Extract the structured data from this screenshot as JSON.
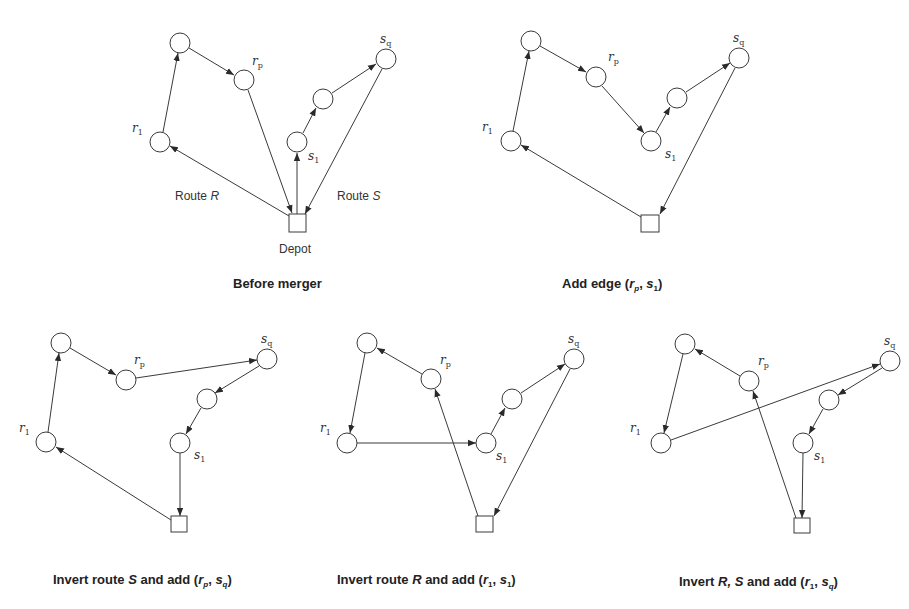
{
  "figure": {
    "panels": [
      {
        "id": "before-merger",
        "caption": "Before merger",
        "labels": {
          "r1": "r",
          "rp": "r",
          "s1": "s",
          "sq": "s",
          "route_r": "Route",
          "route_r_var": "R",
          "route_s": "Route",
          "route_s_var": "S",
          "depot": "Depot"
        }
      },
      {
        "id": "add-edge",
        "caption_prefix": "Add edge (",
        "caption_args": [
          "r",
          "p",
          "s",
          "1"
        ],
        "caption_suffix": ")"
      },
      {
        "id": "invert-s",
        "caption_prefix": "Invert route ",
        "caption_var": "S",
        "caption_mid": " and add (",
        "caption_args": [
          "r",
          "p",
          "s",
          "q"
        ],
        "caption_suffix": ")"
      },
      {
        "id": "invert-r",
        "caption_prefix": "Invert route ",
        "caption_var": "R",
        "caption_mid": " and add (",
        "caption_args": [
          "r",
          "1",
          "s",
          "1"
        ],
        "caption_suffix": ")"
      },
      {
        "id": "invert-rs",
        "caption_prefix": "Invert ",
        "caption_var": "R, S",
        "caption_mid": " and add  (",
        "caption_args": [
          "r",
          "1",
          "s",
          "q"
        ],
        "caption_suffix": ")"
      }
    ],
    "node_labels": {
      "r": "r",
      "s": "s",
      "sub_1": "1",
      "sub_p": "p",
      "sub_q": "q"
    },
    "comma": ", "
  }
}
